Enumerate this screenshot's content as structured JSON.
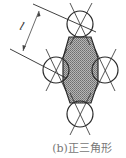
{
  "figure": {
    "caption": "(b)正三角形",
    "dimension_label": "l",
    "colors": {
      "stroke": "#2a2a2a",
      "fill": "#9a9a9a",
      "background": "#ffffff"
    },
    "circles": [
      {
        "name": "top",
        "cx": 80,
        "cy": 24,
        "r": 13
      },
      {
        "name": "left",
        "cx": 56,
        "cy": 70,
        "r": 13
      },
      {
        "name": "right",
        "cx": 105,
        "cy": 70,
        "r": 13
      },
      {
        "name": "bottom",
        "cx": 80,
        "cy": 114,
        "r": 13
      }
    ]
  }
}
